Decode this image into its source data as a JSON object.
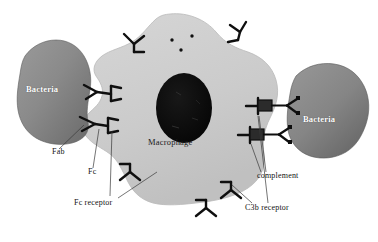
{
  "figure": {
    "background_color": "#ffffff",
    "width": 378,
    "height": 242
  },
  "colors": {
    "macrophage_fill": "#cfcfcf",
    "macrophage_edge": "#b4b4b4",
    "nucleus_fill": "#0d0d0d",
    "bacteria_left_fill": "#8e8e8e",
    "bacteria_left_dark": "#6d6d6d",
    "bacteria_right_fill": "#8a8a8a",
    "bacteria_right_dark": "#6a6a6a",
    "stroke": "#0f0f0f",
    "leader_line": "#3a3a3a",
    "label_text": "#111111",
    "label_text_inverse": "#ffffff"
  },
  "cells": {
    "macrophage": {
      "name": "Macrophage",
      "label": "Macrophage",
      "label_x": 148,
      "label_y": 142,
      "nucleus_name": "nucleus",
      "granules": [
        {
          "cx": 172,
          "cy": 40,
          "r": 1.6
        },
        {
          "cx": 192,
          "cy": 36,
          "r": 1.6
        },
        {
          "cx": 181,
          "cy": 50,
          "r": 1.6
        }
      ]
    },
    "bacteria_left": {
      "name": "Bacteria",
      "label": "Bacteria",
      "label_x": 26,
      "label_y": 89
    },
    "bacteria_right": {
      "name": "Bacteria",
      "label": "Bacteria",
      "label_x": 303,
      "label_y": 119
    }
  },
  "annotations": [
    {
      "id": "fab",
      "label": "Fab",
      "x": 52,
      "y": 152
    },
    {
      "id": "fc",
      "label": "Fc",
      "x": 88,
      "y": 172
    },
    {
      "id": "fc-receptor",
      "label": "Fc receptor",
      "x": 74,
      "y": 203
    },
    {
      "id": "complement",
      "label": "complement",
      "x": 257,
      "y": 176
    },
    {
      "id": "c3b-receptor",
      "label": "C3b receptor",
      "x": 245,
      "y": 208
    }
  ],
  "structures": {
    "antibodies": [
      {
        "id": "antibody-upper",
        "description": "Y-shaped immunoglobulin bridging bacteria to Fc receptor"
      },
      {
        "id": "antibody-lower",
        "description": "Y-shaped immunoglobulin bridging bacteria to Fc receptor"
      }
    ],
    "fc_receptors": [
      {
        "id": "fc-receptor-left-upper"
      },
      {
        "id": "fc-receptor-left-lower"
      }
    ],
    "surface_receptors": [
      {
        "id": "receptor-top-left"
      },
      {
        "id": "receptor-top-right"
      },
      {
        "id": "receptor-bottom-left"
      },
      {
        "id": "receptor-bottom-center"
      },
      {
        "id": "receptor-bottom-right"
      }
    ],
    "c3b_receptors": [
      {
        "id": "c3b-receptor-upper"
      },
      {
        "id": "c3b-receptor-lower"
      }
    ],
    "complement_molecules": [
      {
        "id": "complement-upper"
      },
      {
        "id": "complement-lower"
      }
    ]
  }
}
